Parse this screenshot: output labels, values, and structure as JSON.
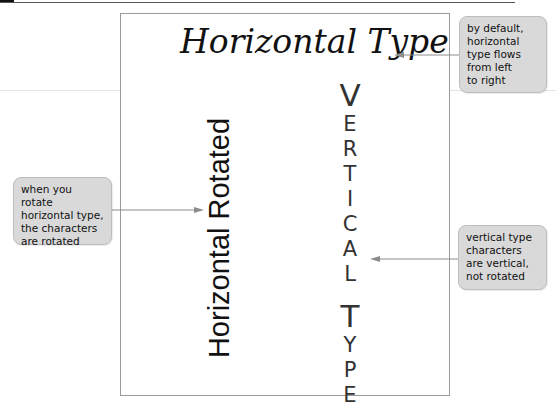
{
  "diagram": {
    "horizontal_type": "Horizontal Type",
    "horizontal_rotated": "Horizontal Rotated",
    "vertical_type": {
      "word1": [
        "V",
        "E",
        "R",
        "T",
        "I",
        "C",
        "A",
        "L"
      ],
      "word2": [
        "T",
        "Y",
        "P",
        "E"
      ]
    }
  },
  "callouts": [
    {
      "id": "horizontal",
      "lines": [
        "by default,",
        "horizontal",
        "type flows",
        "from left",
        "to right"
      ]
    },
    {
      "id": "rotated",
      "lines": [
        "when you rotate",
        "horizontal type,",
        "the characters",
        "are rotated"
      ]
    },
    {
      "id": "vertical",
      "lines": [
        "vertical type",
        "characters",
        "are vertical,",
        "not rotated"
      ]
    }
  ],
  "colors": {
    "callout_bg": "#d9d9d9",
    "arrow": "#8c8c8c",
    "frame": "#9a9a9a",
    "text": "#111111"
  }
}
